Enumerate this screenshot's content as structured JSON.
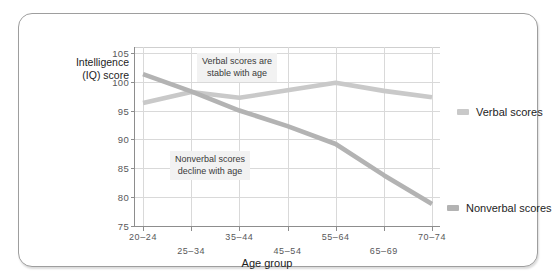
{
  "chart_data": {
    "type": "line",
    "title": "",
    "xlabel": "Age group",
    "ylabel": "Intelligence\n(IQ) score",
    "ylabel_line1": "Intelligence",
    "ylabel_line2": "(IQ) score",
    "categories": [
      "20–24",
      "25–34",
      "35–44",
      "45–54",
      "55–64",
      "65–69",
      "70–74"
    ],
    "xtick_labels": [
      "20–24",
      "25–34",
      "35–44",
      "45–54",
      "55–64",
      "65–69",
      "70–74"
    ],
    "ytick_labels": [
      "75",
      "80",
      "85",
      "90",
      "95",
      "100",
      "105"
    ],
    "yticks": [
      75,
      80,
      85,
      90,
      95,
      100,
      105
    ],
    "ylim": [
      75,
      106
    ],
    "grid": "both",
    "legend_position": "right",
    "series": [
      {
        "name": "Verbal scores",
        "color": "#c9c9c9",
        "values": [
          96.3,
          98.2,
          97.2,
          98.5,
          99.8,
          98.4,
          97.3
        ]
      },
      {
        "name": "Nonverbal scores",
        "color": "#b3b3b3",
        "values": [
          101.3,
          98.3,
          95.0,
          92.3,
          89.2,
          83.8,
          78.8
        ]
      }
    ],
    "annotations": [
      {
        "text": "Verbal scores are\nstable with age",
        "target_series": "Verbal scores"
      },
      {
        "text": "Nonverbal scores\ndecline with age",
        "target_series": "Nonverbal scores"
      }
    ]
  },
  "axis": {
    "x_title": "Age group",
    "y_title_line1": "Intelligence",
    "y_title_line2": "(IQ) score"
  },
  "legend": {
    "items": [
      {
        "label": "Verbal scores",
        "color": "#c9c9c9"
      },
      {
        "label": "Nonverbal scores",
        "color": "#b3b3b3"
      }
    ]
  },
  "annotations": {
    "verbal": "Verbal scores are\nstable with age",
    "nonverbal": "Nonverbal scores\ndecline with age"
  },
  "colors": {
    "verbal_line": "#c9c9c9",
    "nonverbal_line": "#b3b3b3",
    "grid": "#d9d9d9",
    "axis": "#8d8d8d",
    "frame_border": "#9e9e9e",
    "annotation_bg": "#f2f2f2",
    "text": "#1d1d1d",
    "tick_text": "#58585a",
    "background": "#ffffff"
  }
}
